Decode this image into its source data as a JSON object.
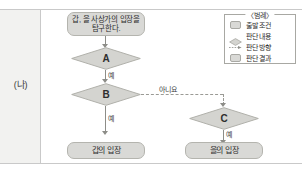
{
  "panel": {
    "left_label": "(나)"
  },
  "flow": {
    "start": {
      "id": "start-node",
      "text": "갑, 을 사상가의 입장을 탐구한다."
    },
    "decisions": [
      {
        "id": "decision-a",
        "label": "A"
      },
      {
        "id": "decision-b",
        "label": "B"
      },
      {
        "id": "decision-c",
        "label": "C"
      }
    ],
    "results": [
      {
        "id": "result-gap",
        "text": "갑의 입장"
      },
      {
        "id": "result-eul",
        "text": "을의 입장"
      }
    ],
    "edges": [
      {
        "id": "edge-a-yes",
        "label": "예"
      },
      {
        "id": "edge-b-yes",
        "label": "예"
      },
      {
        "id": "edge-b-no",
        "label": "아니요"
      },
      {
        "id": "edge-c-yes",
        "label": "예"
      }
    ]
  },
  "legend": {
    "title": "〈범례〉",
    "items": [
      {
        "icon": "rounded-box-icon",
        "label": "출발 조건"
      },
      {
        "icon": "diamond-icon",
        "label": "판단 내용"
      },
      {
        "icon": "dashed-arrow-icon",
        "label": "판단 방향"
      },
      {
        "icon": "rounded-box-icon",
        "label": "판단 결과"
      }
    ]
  },
  "colors": {
    "node_fill": "#d9d9d6",
    "node_stroke": "#b4b4ae",
    "connector": "#8d8d88",
    "panel_bg": "#f2f2f0",
    "rule": "#c9c9c9"
  }
}
